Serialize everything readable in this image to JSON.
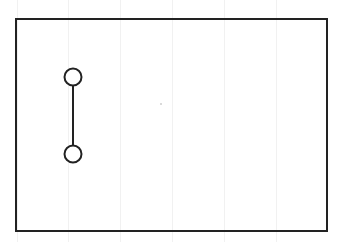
{
  "diagram": {
    "type": "schematic",
    "background": "#ffffff",
    "grid": {
      "orientation": "vertical",
      "color": "#f1f1f1",
      "x_positions": [
        17,
        68,
        120,
        172,
        224,
        276
      ]
    },
    "frame": {
      "x": 16,
      "y": 19,
      "width": 311,
      "height": 212,
      "stroke": "#222222",
      "stroke_width": 2
    },
    "connector": {
      "node_top": {
        "cx": 73,
        "cy": 77,
        "r": 8.5
      },
      "node_bottom": {
        "cx": 73,
        "cy": 154,
        "r": 8.5
      },
      "link": {
        "x": 73,
        "y1": 86,
        "y2": 145
      },
      "stroke": "#222222",
      "stroke_width": 2
    },
    "speck": {
      "cx": 161,
      "cy": 104,
      "r": 0.8,
      "color": "#aaaaaa"
    }
  }
}
